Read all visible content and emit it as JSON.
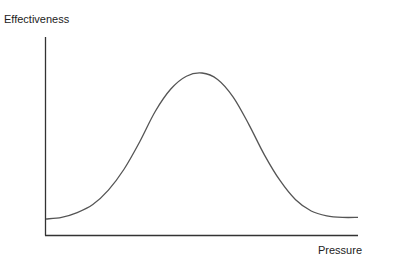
{
  "chart_data": {
    "type": "line",
    "title": "",
    "xlabel": "Pressure",
    "ylabel": "Effectiveness",
    "xlim": [
      0,
      1
    ],
    "ylim": [
      0,
      1
    ],
    "grid": false,
    "legend": "none",
    "x_ticks": [],
    "y_ticks": [],
    "series": [
      {
        "name": "Effectiveness vs Pressure",
        "color": "#555555",
        "x": [
          0,
          0.05,
          0.1,
          0.15,
          0.2,
          0.25,
          0.3,
          0.35,
          0.4,
          0.45,
          0.5,
          0.55,
          0.6,
          0.65,
          0.7,
          0.75,
          0.8,
          0.85,
          0.9,
          0.95,
          1.0
        ],
        "y": [
          0.09,
          0.1,
          0.13,
          0.18,
          0.27,
          0.4,
          0.57,
          0.76,
          0.9,
          0.98,
          1.0,
          0.96,
          0.85,
          0.68,
          0.49,
          0.33,
          0.21,
          0.14,
          0.11,
          0.1,
          0.1
        ]
      }
    ]
  }
}
